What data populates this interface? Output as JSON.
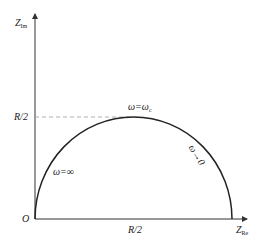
{
  "diagram": {
    "title": "",
    "type": "impedance semicircle (Nyquist plot)",
    "axes": {
      "y_label": "Z",
      "y_label_sub": "Im",
      "x_label": "Z",
      "x_label_sub": "Re",
      "origin_label": "O"
    },
    "ticks": {
      "y_tick": "R/2",
      "x_tick": "R/2"
    },
    "annotations": {
      "apex": "ω=ω",
      "apex_sub": "c",
      "left_branch": "ω=∞",
      "right_branch": "ω→0"
    },
    "colors": {
      "curve": "#222222",
      "axis": "#333333",
      "dashed": "#999999"
    }
  }
}
